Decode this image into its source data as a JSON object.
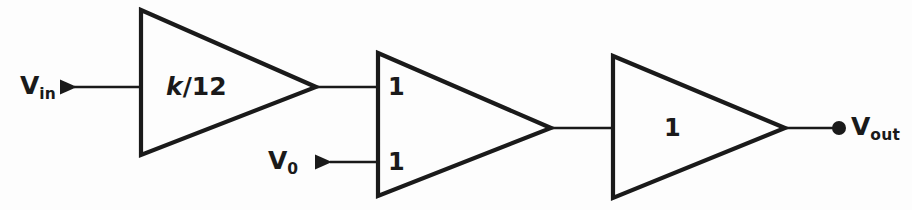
{
  "diagram": {
    "background_color": "#fdfdfd",
    "line_color": "#1a1a1a",
    "signals": {
      "input": {
        "symbol": "V",
        "subscript": "in"
      },
      "intermediate": {
        "symbol": "V",
        "subscript": "0"
      },
      "output": {
        "symbol": "V",
        "subscript": "out"
      }
    },
    "blocks": [
      {
        "id": "amp1",
        "gain": "k/12",
        "gain_main": "k",
        "gain_rest": "/12",
        "italic_part": true
      },
      {
        "id": "amp2",
        "gain_top": "1",
        "gain_bottom": "1"
      },
      {
        "id": "amp3",
        "gain": "1"
      }
    ]
  }
}
